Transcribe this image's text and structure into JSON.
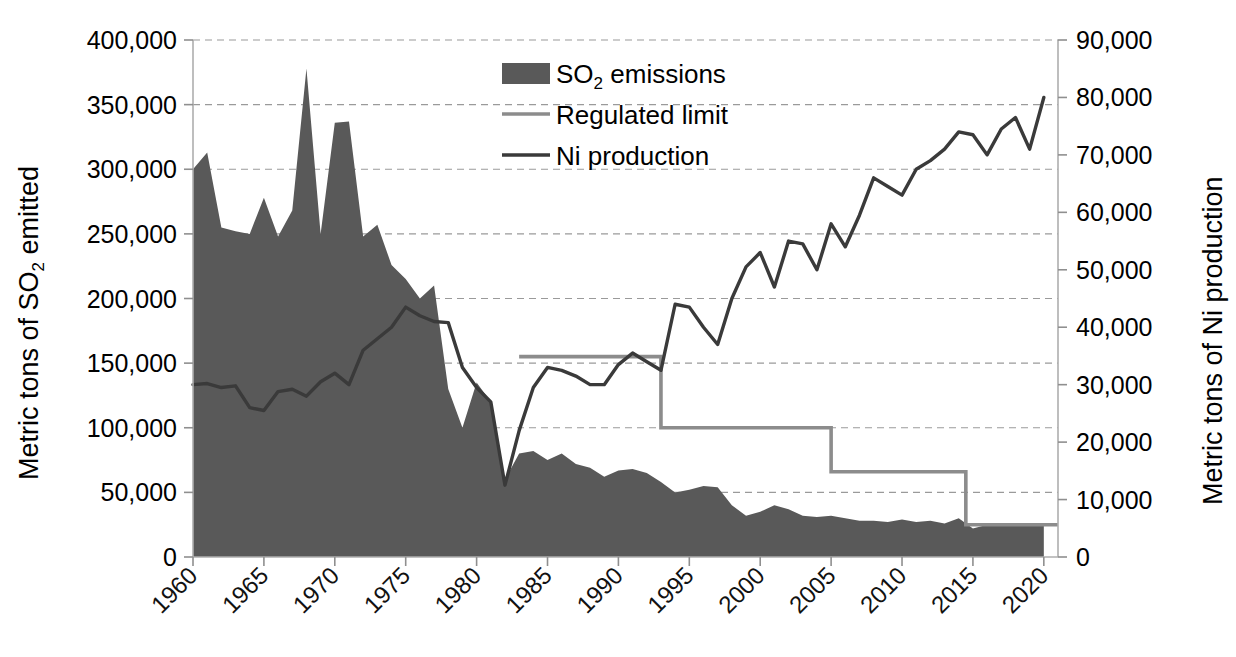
{
  "chart_data": {
    "type": "area",
    "title": "",
    "xlabel": "",
    "ylabel": "Metric tons of SO2 emitted",
    "ylabel_main": "Metric tons of SO",
    "ylabel_sub": "2",
    "ylabel_tail": " emitted",
    "y2label": "Metric tons of Ni production",
    "grid": true,
    "legend_position": "top-center",
    "xlim": [
      1960,
      2021
    ],
    "ylim": [
      0,
      400000
    ],
    "y2lim": [
      0,
      90000
    ],
    "xticks": [
      1960,
      1965,
      1970,
      1975,
      1980,
      1985,
      1990,
      1995,
      2000,
      2005,
      2010,
      2015,
      2020
    ],
    "xtick_labels": [
      "1960",
      "1965",
      "1970",
      "1975",
      "1980",
      "1985",
      "1990",
      "1995",
      "2000",
      "2005",
      "2010",
      "2015",
      "2020"
    ],
    "yticks": [
      0,
      50000,
      100000,
      150000,
      200000,
      250000,
      300000,
      350000,
      400000
    ],
    "ytick_labels": [
      "0",
      "50,000",
      "100,000",
      "150,000",
      "200,000",
      "250,000",
      "300,000",
      "350,000",
      "400,000"
    ],
    "y2ticks": [
      0,
      10000,
      20000,
      30000,
      40000,
      50000,
      60000,
      70000,
      80000,
      90000
    ],
    "y2tick_labels": [
      "0",
      "10,000",
      "20,000",
      "30,000",
      "40,000",
      "50,000",
      "60,000",
      "70,000",
      "80,000",
      "90,000"
    ],
    "colors": {
      "so2_fill": "#595959",
      "regulated_limit": "#8c8c8c",
      "ni_production": "#3a3a3a",
      "grid": "#9a9a9a",
      "axis": "#aeaeae",
      "text": "#000000",
      "background": "#ffffff"
    },
    "legend": [
      {
        "label": "SO2 emissions",
        "label_main": "SO",
        "label_sub": "2",
        "label_tail": " emissions",
        "type": "swatch",
        "color": "#595959"
      },
      {
        "label": "Regulated limit",
        "label_main": "Regulated limit",
        "label_sub": "",
        "label_tail": "",
        "type": "line",
        "color": "#8c8c8c"
      },
      {
        "label": "Ni production",
        "label_main": "Ni production",
        "label_sub": "",
        "label_tail": "",
        "type": "line",
        "color": "#3a3a3a"
      }
    ],
    "series": [
      {
        "name": "SO2 emissions",
        "axis": "left",
        "units": "metric tons",
        "x": [
          1960,
          1961,
          1962,
          1963,
          1964,
          1965,
          1966,
          1967,
          1968,
          1969,
          1970,
          1971,
          1972,
          1973,
          1974,
          1975,
          1976,
          1977,
          1978,
          1979,
          1980,
          1981,
          1982,
          1983,
          1984,
          1985,
          1986,
          1987,
          1988,
          1989,
          1990,
          1991,
          1992,
          1993,
          1994,
          1995,
          1996,
          1997,
          1998,
          1999,
          2000,
          2001,
          2002,
          2003,
          2004,
          2005,
          2006,
          2007,
          2008,
          2009,
          2010,
          2011,
          2012,
          2013,
          2014,
          2015,
          2016,
          2017,
          2018,
          2019,
          2020
        ],
        "values": [
          300000,
          313000,
          255000,
          252000,
          250000,
          278000,
          248000,
          268000,
          378000,
          250000,
          336000,
          337000,
          248000,
          257000,
          226000,
          215000,
          200000,
          210000,
          130000,
          100000,
          135000,
          120000,
          60000,
          80000,
          82000,
          75000,
          80000,
          72000,
          69000,
          62000,
          67000,
          68000,
          65000,
          58000,
          50000,
          52000,
          55000,
          54000,
          40000,
          32000,
          35000,
          40000,
          37000,
          32000,
          31000,
          32000,
          30000,
          28000,
          28000,
          27000,
          29000,
          27000,
          28000,
          26000,
          30000,
          22000,
          25000,
          25000,
          25000,
          26000,
          26000
        ]
      },
      {
        "name": "Ni production",
        "axis": "right",
        "units": "metric tons",
        "x": [
          1960,
          1961,
          1962,
          1963,
          1964,
          1965,
          1966,
          1967,
          1968,
          1969,
          1970,
          1971,
          1972,
          1973,
          1974,
          1975,
          1976,
          1977,
          1978,
          1979,
          1980,
          1981,
          1982,
          1983,
          1984,
          1985,
          1986,
          1987,
          1988,
          1989,
          1990,
          1991,
          1992,
          1993,
          1994,
          1995,
          1996,
          1997,
          1998,
          1999,
          2000,
          2001,
          2002,
          2003,
          2004,
          2005,
          2006,
          2007,
          2008,
          2009,
          2010,
          2011,
          2012,
          2013,
          2014,
          2015,
          2016,
          2017,
          2018,
          2019,
          2020
        ],
        "values": [
          30000,
          30200,
          29500,
          29800,
          26000,
          25500,
          28800,
          29200,
          28000,
          30500,
          32000,
          30000,
          36000,
          38000,
          40000,
          43500,
          42000,
          41000,
          40800,
          33000,
          29500,
          27000,
          12500,
          22000,
          29500,
          33000,
          32500,
          31500,
          30000,
          30000,
          33500,
          35500,
          34000,
          32500,
          44000,
          43500,
          40000,
          37000,
          45000,
          50500,
          53000,
          47000,
          55000,
          54500,
          50000,
          58000,
          54000,
          59500,
          66000,
          64500,
          63000,
          67500,
          69000,
          71000,
          74000,
          73500,
          70000,
          74500,
          76500,
          71000,
          80000
        ]
      }
    ],
    "step_series": [
      {
        "name": "Regulated limit",
        "axis": "left",
        "units": "metric tons",
        "segments": [
          {
            "x_start": 1983,
            "x_end": 1993,
            "value": 155000
          },
          {
            "x_start": 1993,
            "x_end": 2005,
            "value": 100000
          },
          {
            "x_start": 2005,
            "x_end": 2014.5,
            "value": 66000
          },
          {
            "x_start": 2014.5,
            "x_end": 2021,
            "value": 25000
          }
        ],
        "drops": [
          {
            "x": 1993,
            "from": 155000,
            "to": 100000
          },
          {
            "x": 2005,
            "from": 100000,
            "to": 66000
          },
          {
            "x": 2014.5,
            "from": 66000,
            "to": 25000
          }
        ]
      }
    ],
    "annotations": []
  }
}
